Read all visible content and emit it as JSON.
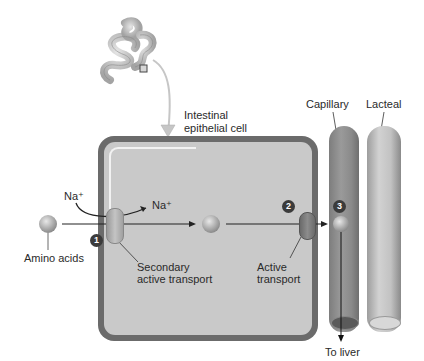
{
  "diagram": {
    "type": "amino acid absorption in small intestine",
    "labels": {
      "cell": "Intestinal epithelial cell",
      "cell_line1": "Intestinal",
      "cell_line2": "epithelial cell",
      "capillary": "Capillary",
      "lacteal": "Lacteal",
      "na_outside": "Na⁺",
      "na_inside": "Na⁺",
      "amino_acids": "Amino acids",
      "secondary_line1": "Secondary",
      "secondary_line2": "active transport",
      "active_line1": "Active",
      "active_line2": "transport",
      "to_liver": "To liver"
    },
    "steps": [
      {
        "number": "1",
        "description": "Secondary active transport"
      },
      {
        "number": "2",
        "description": "Active transport"
      },
      {
        "number": "3",
        "description": "Enters capillary"
      }
    ],
    "colors": {
      "cell_border": "#6b6b6b",
      "cell_fill": "#c9c9c9",
      "capillary": "#8a8a8a",
      "lacteal": "#c2c2c2",
      "badge": "#3b3b3b",
      "carrier_1": "#b3b3b3",
      "carrier_2": "#7a7a7a"
    }
  }
}
